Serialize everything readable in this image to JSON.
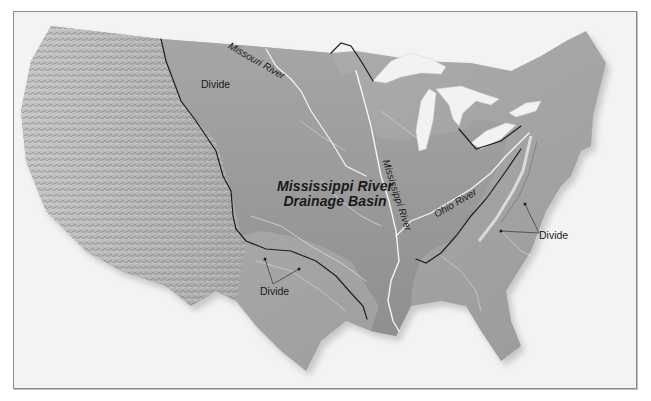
{
  "map": {
    "title": "Mississippi River Drainage Basin",
    "region": "Contiguous United States (shaded relief)",
    "style": "grayscale shaded relief",
    "colors": {
      "background": "#f3f3f3",
      "land_west": "#b9b9b9",
      "land_basin": "#9d9d9d",
      "land_east": "#a8a8a8",
      "water": "#f2f2f2",
      "divide_line": "#1e1e1e",
      "river_line": "#f5f5f5",
      "frame": "#8c8c8c"
    },
    "labels": {
      "basin_line1": "Mississippi River",
      "basin_line2": "Drainage Basin",
      "missouri_river": "Missouri River",
      "mississippi_river": "Mississippi River",
      "ohio_river": "Ohio River",
      "divide_north": "Divide",
      "divide_south": "Divide",
      "divide_east": "Divide"
    },
    "features": {
      "rivers": [
        "Missouri River",
        "Mississippi River",
        "Ohio River"
      ],
      "divides": [
        "Continental Divide (west)",
        "Southern divide (Texas)",
        "Appalachian divide (east)"
      ],
      "lakes": [
        "Great Lakes"
      ]
    }
  }
}
